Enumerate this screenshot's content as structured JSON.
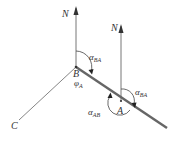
{
  "diagram": {
    "labels": {
      "north_B": "N",
      "north_A": "N",
      "point_B": "B",
      "point_A": "A",
      "point_C": "C",
      "alpha_BA_at_B": {
        "symbol": "α",
        "sub": "BA"
      },
      "alpha_BA_at_A": {
        "symbol": "α",
        "sub": "BA"
      },
      "alpha_AB": {
        "symbol": "α",
        "sub": "AB"
      },
      "phi_A": {
        "symbol": "φ",
        "sub": "A"
      }
    },
    "colors": {
      "stroke": "#555555",
      "thick_line": "#666666",
      "text": "#333333"
    }
  }
}
